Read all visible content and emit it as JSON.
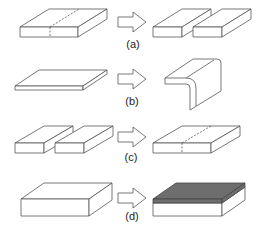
{
  "figure": {
    "panels": [
      {
        "id": "a",
        "label": "(a)",
        "description": "Single slab with dashed cut line splits into two separate slabs"
      },
      {
        "id": "b",
        "label": "(b)",
        "description": "Thin flat plate bent into an L-shaped angle profile"
      },
      {
        "id": "c",
        "label": "(c)",
        "description": "Two separate slabs joined into a single slab with dashed joint line"
      },
      {
        "id": "d",
        "label": "(d)",
        "description": "Plain slab receives a dark coating layer on its top surface"
      }
    ],
    "colors": {
      "line": "#555555",
      "coating": "#6e6e6e",
      "coating_edge": "#444444",
      "fill": "#ffffff"
    },
    "arrow_icon": "hollow-right-arrow"
  }
}
